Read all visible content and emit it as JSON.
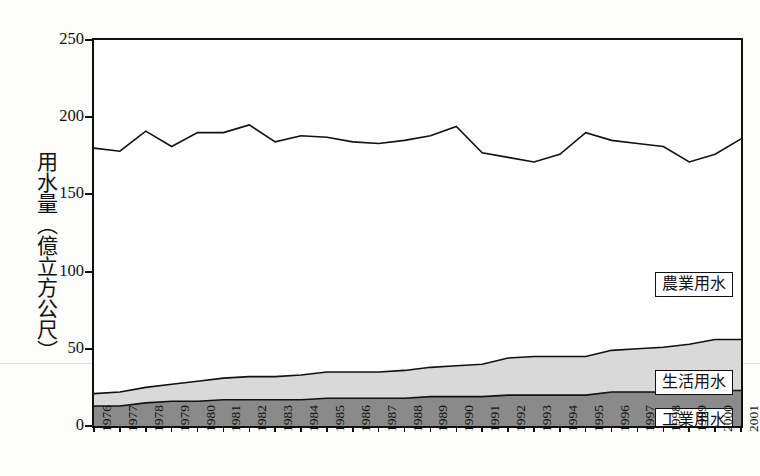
{
  "axis": {
    "y_title": "用水量（億立方公尺）",
    "y_ticks": [
      0,
      50,
      100,
      150,
      200,
      250
    ],
    "x_ticks": [
      "1976",
      "1977",
      "1978",
      "1979",
      "1980",
      "1981",
      "1982",
      "1983",
      "1984",
      "1985",
      "1986",
      "1987",
      "1988",
      "1989",
      "1990",
      "1991",
      "1992",
      "1993",
      "1994",
      "1995",
      "1996",
      "1997",
      "1998",
      "1999",
      "2000",
      "2001"
    ]
  },
  "legend": {
    "agriculture": "農業用水",
    "domestic": "生活用水",
    "industrial": "工業用水"
  },
  "colors": {
    "agriculture": "#ffffff",
    "domestic": "#d9d9d9",
    "industrial": "#8a8a8a",
    "line": "#111111"
  },
  "chart_data": {
    "type": "area",
    "title": "",
    "xlabel": "",
    "ylabel": "用水量（億立方公尺）",
    "ylim": [
      0,
      250
    ],
    "grid": false,
    "legend_position": "inside-right",
    "categories": [
      "1976",
      "1977",
      "1978",
      "1979",
      "1980",
      "1981",
      "1982",
      "1983",
      "1984",
      "1985",
      "1986",
      "1987",
      "1988",
      "1989",
      "1990",
      "1991",
      "1992",
      "1993",
      "1994",
      "1995",
      "1996",
      "1997",
      "1998",
      "1999",
      "2000",
      "2001"
    ],
    "series": [
      {
        "name": "工業用水",
        "values": [
          13,
          13,
          15,
          16,
          16,
          17,
          17,
          17,
          17,
          18,
          18,
          18,
          18,
          19,
          19,
          19,
          20,
          20,
          20,
          20,
          22,
          22,
          22,
          23,
          23,
          23
        ]
      },
      {
        "name": "生活用水",
        "values": [
          8,
          9,
          10,
          11,
          13,
          14,
          15,
          15,
          16,
          17,
          17,
          17,
          18,
          19,
          20,
          21,
          24,
          25,
          25,
          25,
          27,
          28,
          29,
          30,
          33,
          33
        ]
      },
      {
        "name": "農業用水",
        "values": [
          159,
          156,
          166,
          154,
          161,
          159,
          163,
          152,
          155,
          152,
          149,
          148,
          149,
          150,
          155,
          137,
          130,
          126,
          131,
          145,
          136,
          133,
          130,
          118,
          120,
          130
        ]
      }
    ],
    "totals": [
      180,
      178,
      191,
      181,
      190,
      190,
      195,
      184,
      188,
      187,
      184,
      183,
      185,
      188,
      194,
      177,
      174,
      171,
      176,
      190,
      185,
      183,
      181,
      171,
      176,
      186
    ]
  }
}
